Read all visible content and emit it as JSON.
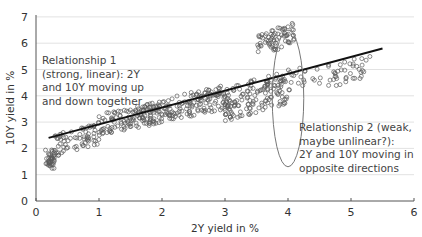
{
  "chart_data": {
    "type": "scatter",
    "title": "",
    "xlabel": "2Y yield in %",
    "ylabel": "10Y yield in %",
    "xlim": [
      0,
      6
    ],
    "ylim": [
      0,
      7
    ],
    "xticks": [
      0,
      1,
      2,
      3,
      4,
      5,
      6
    ],
    "yticks": [
      0,
      1,
      2,
      3,
      4,
      5,
      6,
      7
    ],
    "grid": "horizontal",
    "legend": null,
    "series": [
      {
        "name": "2Y vs 10Y yield observations",
        "marker": "open-circle",
        "clusters": [
          {
            "x_range": [
              0.15,
              0.3
            ],
            "y_range": [
              1.2,
              2.0
            ],
            "note": "vertical cluster near x=0.2"
          },
          {
            "x_range": [
              0.3,
              1.0
            ],
            "y_range": [
              1.7,
              3.0
            ]
          },
          {
            "x_range": [
              1.0,
              2.0
            ],
            "y_range": [
              2.5,
              3.8
            ]
          },
          {
            "x_range": [
              2.0,
              3.0
            ],
            "y_range": [
              3.0,
              4.4
            ]
          },
          {
            "x_range": [
              3.0,
              4.0
            ],
            "y_range": [
              3.0,
              5.0
            ]
          },
          {
            "x_range": [
              3.5,
              4.1
            ],
            "y_range": [
              5.5,
              6.8
            ],
            "note": "upper cluster"
          },
          {
            "x_range": [
              4.0,
              5.3
            ],
            "y_range": [
              4.1,
              5.5
            ]
          }
        ]
      },
      {
        "name": "Linear trend",
        "type": "line",
        "x": [
          0.2,
          5.5
        ],
        "y": [
          2.4,
          5.8
        ]
      }
    ],
    "annotations": [
      {
        "text": "Relationship 1 (strong, linear): 2Y and 10Y moving up and down together",
        "x": 0.05,
        "y": 5.0
      },
      {
        "text": "Relationship 2 (weak, maybe unlinear?): 2Y and 10Y moving in opposite directions",
        "x": 4.2,
        "y": 3.0
      },
      {
        "shape": "ellipse",
        "center": [
          4.0,
          3.9
        ],
        "x_radius": 0.25,
        "y_radius": 2.6
      }
    ]
  },
  "labels": {
    "xlabel": "2Y yield in %",
    "ylabel": "10Y yield in %",
    "annot1": [
      "Relationship 1",
      "(strong, linear): 2Y",
      "and 10Y moving up",
      "and down together"
    ],
    "annot2": [
      "Relationship 2 (weak,",
      "maybe unlinear?):",
      "2Y and 10Y moving in",
      "opposite directions"
    ],
    "xticks": [
      "0",
      "1",
      "2",
      "3",
      "4",
      "5",
      "6"
    ],
    "yticks": [
      "0",
      "1",
      "2",
      "3",
      "4",
      "5",
      "6",
      "7"
    ]
  }
}
